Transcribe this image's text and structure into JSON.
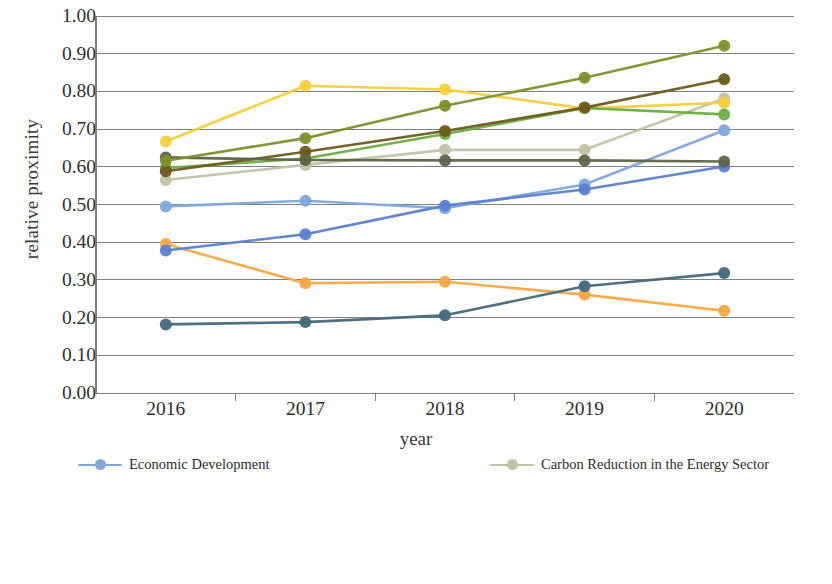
{
  "chart_data": {
    "type": "line",
    "title": "",
    "xlabel": "year",
    "ylabel": "relative proximity",
    "x": [
      "2016",
      "2017",
      "2018",
      "2019",
      "2020"
    ],
    "categories": [
      "2016",
      "2017",
      "2018",
      "2019",
      "2020"
    ],
    "ylim": [
      0.0,
      1.0
    ],
    "ytick_labels": [
      "0.00",
      "0.10",
      "0.20",
      "0.30",
      "0.40",
      "0.50",
      "0.60",
      "0.70",
      "0.80",
      "0.90",
      "1.00"
    ],
    "ytick_values": [
      0.0,
      0.1,
      0.2,
      0.3,
      0.4,
      0.5,
      0.6,
      0.7,
      0.8,
      0.9,
      1.0
    ],
    "grid": "horizontal",
    "legend_position": "bottom",
    "legend_columns": 2,
    "series": [
      {
        "name": "Economic Development",
        "color": "#7fa7dc",
        "values": [
          0.495,
          0.51,
          0.49,
          0.553,
          0.697
        ]
      },
      {
        "name": "Energy Security",
        "color": "#f5a742",
        "values": [
          0.395,
          0.291,
          0.295,
          0.261,
          0.218
        ]
      },
      {
        "name": "Carbon Reduction in the Energy Sector",
        "color": "#c3c2a6",
        "values": [
          0.565,
          0.605,
          0.645,
          0.645,
          0.781
        ]
      },
      {
        "name": "Carbon Reduction in the Industry Sector",
        "color": "#f5cd3c",
        "values": [
          0.667,
          0.815,
          0.805,
          0.755,
          0.77
        ]
      },
      {
        "name": "Carbon Reduction in the Construction Industry",
        "color": "#5b7fd1",
        "values": [
          0.378,
          0.421,
          0.497,
          0.54,
          0.601
        ]
      },
      {
        "name": "Carbon Reduction in the Transportation Sector",
        "color": "#6aad43",
        "values": [
          0.597,
          0.622,
          0.687,
          0.756,
          0.739
        ]
      },
      {
        "name": "Carbon Reduction in the Agriculture Sector",
        "color": "#44697b",
        "values": [
          0.182,
          0.188,
          0.206,
          0.283,
          0.318
        ]
      },
      {
        "name": "Carbon Reduction in Residential Lives",
        "color": "#6e5a1e",
        "values": [
          0.588,
          0.64,
          0.695,
          0.757,
          0.832
        ]
      },
      {
        "name": "Carbon Sink Enhancement Field",
        "color": "#5e6447",
        "values": [
          0.625,
          0.618,
          0.617,
          0.617,
          0.614
        ]
      },
      {
        "name": "Residents’ lives",
        "color": "#7f8f2c",
        "values": [
          0.616,
          0.676,
          0.762,
          0.836,
          0.921
        ]
      }
    ]
  },
  "legend": {
    "left_column": [
      "Economic Development",
      "Carbon Reduction in the Energy Sector",
      "Carbon Reduction in the Construction Industry",
      "Carbon Reduction in the Agriculture Sector",
      "Carbon Sink Enhancement Field"
    ],
    "right_column": [
      "Energy Security",
      "Carbon Reduction in the Industry Sector",
      "Carbon Reduction in the Transportation Sector",
      "Carbon Reduction in Residential Lives",
      "Residents’ lives"
    ]
  }
}
